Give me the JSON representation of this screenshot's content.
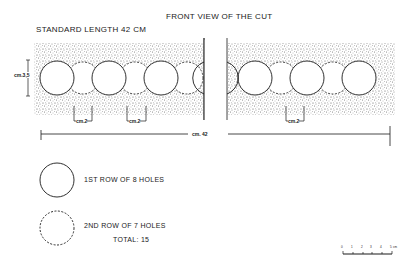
{
  "title": "FRONT VIEW OF THE CUT",
  "subtitle": "STANDARD LENGTH 42 CM",
  "dimensions": {
    "height_label": "cm.3,5",
    "spacing_label": "cm.2",
    "total_length_label": "cm. 42"
  },
  "legend": [
    {
      "symbol": "solid-circle",
      "label": "1ST ROW OF 8 HOLES"
    },
    {
      "symbol": "dashed-circle",
      "label": "2ND ROW OF 7 HOLES"
    }
  ],
  "total": "TOTAL: 15",
  "scale_bar": {
    "ticks": [
      "0",
      "1",
      "2",
      "3",
      "4",
      "5"
    ],
    "unit": "cm"
  },
  "colors": {
    "ink": "#1a1a1a",
    "stipple": "#9a9a9a"
  }
}
